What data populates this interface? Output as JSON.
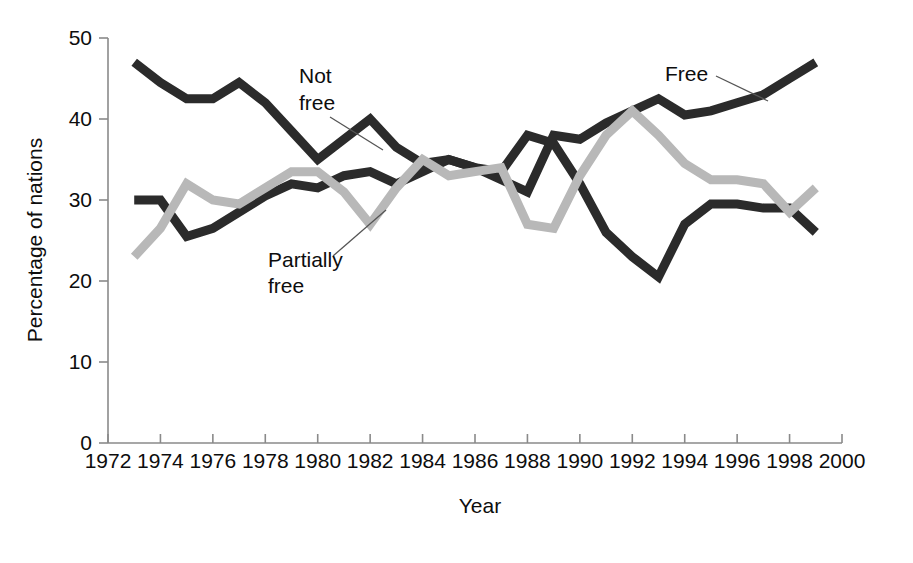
{
  "chart_data": {
    "type": "line",
    "title": "",
    "subtitle": "",
    "xlabel": "Year",
    "ylabel": "Percentage of nations",
    "xlim": [
      1972,
      2000
    ],
    "ylim": [
      0,
      50
    ],
    "xticks": [
      1972,
      1974,
      1976,
      1978,
      1980,
      1982,
      1984,
      1986,
      1988,
      1990,
      1992,
      1994,
      1996,
      1998,
      2000
    ],
    "xtick_labels": [
      "1972",
      "1974",
      "1976",
      "1978",
      "1980",
      "1982",
      "1984",
      "1986",
      "1988",
      "1990",
      "1992",
      "1994",
      "1996",
      "1998",
      "2000"
    ],
    "yticks": [
      0,
      10,
      20,
      30,
      40,
      50
    ],
    "ytick_labels": [
      "0",
      "10",
      "20",
      "30",
      "40",
      "50"
    ],
    "grid": false,
    "legend_position": "inline-annotations",
    "x": [
      1973,
      1974,
      1975,
      1976,
      1977,
      1978,
      1979,
      1980,
      1981,
      1982,
      1983,
      1984,
      1985,
      1986,
      1987,
      1988,
      1989,
      1990,
      1991,
      1992,
      1993,
      1994,
      1995,
      1996,
      1997,
      1998,
      1999
    ],
    "series": [
      {
        "name": "Not free",
        "color": "#2b2b2b",
        "values": [
          47.0,
          44.5,
          42.5,
          42.5,
          44.5,
          42.0,
          38.5,
          35.0,
          37.5,
          40.0,
          36.5,
          34.5,
          35.0,
          34.0,
          33.5,
          38.0,
          37.0,
          32.0,
          26.0,
          23.0,
          20.5,
          27.0,
          29.5,
          29.5,
          29.0,
          29.0,
          26.0
        ]
      },
      {
        "name": "Free",
        "color": "#2b2b2b",
        "values": [
          30.0,
          30.0,
          25.5,
          26.5,
          28.5,
          30.5,
          32.0,
          31.5,
          33.0,
          33.5,
          32.0,
          33.5,
          35.0,
          34.0,
          32.5,
          31.0,
          38.0,
          37.5,
          39.5,
          41.0,
          42.5,
          40.5,
          41.0,
          42.0,
          43.0,
          45.0,
          47.0
        ]
      },
      {
        "name": "Partially free",
        "color": "#b8b8b8",
        "values": [
          23.0,
          26.5,
          32.0,
          30.0,
          29.5,
          31.5,
          33.5,
          33.5,
          31.0,
          27.0,
          31.5,
          35.0,
          33.0,
          33.5,
          34.0,
          27.0,
          26.5,
          33.0,
          38.0,
          41.0,
          38.0,
          34.5,
          32.5,
          32.5,
          32.0,
          28.5,
          31.5
        ]
      }
    ],
    "annotations": [
      {
        "id": "not-free",
        "text_line1": "Not",
        "text_line2": "free",
        "series": "Not free"
      },
      {
        "id": "partially-free",
        "text_line1": "Partially",
        "text_line2": "free",
        "series": "Partially free"
      },
      {
        "id": "free",
        "text_line1": "Free",
        "text_line2": "",
        "series": "Free"
      }
    ]
  }
}
